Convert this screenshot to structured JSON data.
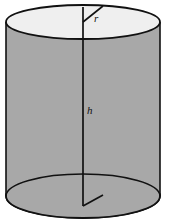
{
  "figure": {
    "name": "right-circular-cylinder",
    "shape_type": "cylinder",
    "background_color": "#ffffff",
    "outline_color": "#111111",
    "lateral_surface_color": "#a8a8a8",
    "top_face_color": "#efefef",
    "bottom_face_color": "#efefef",
    "labels": {
      "radius": "r",
      "height": "h"
    },
    "geometry": {
      "left_edge_x": 6,
      "right_edge_x": 160,
      "top_center_x": 83,
      "top_center_y": 22,
      "bottom_center_x": 83,
      "bottom_center_y": 196,
      "top_rx": 77,
      "top_ry": 17,
      "bottom_rx": 77,
      "bottom_ry": 22,
      "axis_top_y": 7,
      "axis_bottom_y": 206,
      "radius_tip_x": 103,
      "radius_tip_y": 6,
      "bottom_notch_tip_x": 103,
      "bottom_notch_tip_y": 195
    }
  }
}
